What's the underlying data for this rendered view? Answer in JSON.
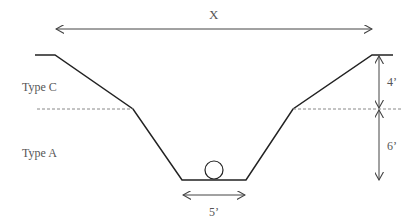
{
  "diagram": {
    "labels": {
      "top_width": "X",
      "type_upper": "Type C",
      "type_lower": "Type A",
      "upper_depth": "4’",
      "lower_depth": "6’",
      "bottom_width": "5’"
    },
    "colors": {
      "profile": "#222222",
      "dimension": "#444444",
      "dashed": "#888888",
      "text": "#555555"
    },
    "geometry": {
      "profile_points": [
        [
          35,
          55
        ],
        [
          55,
          55
        ],
        [
          133,
          109
        ],
        [
          182,
          180
        ],
        [
          246,
          180
        ],
        [
          293,
          109
        ],
        [
          372,
          55
        ],
        [
          393,
          55
        ]
      ],
      "break_line_y": 109,
      "pipe_circle": {
        "cx": 214,
        "cy": 170,
        "r": 9
      }
    }
  }
}
